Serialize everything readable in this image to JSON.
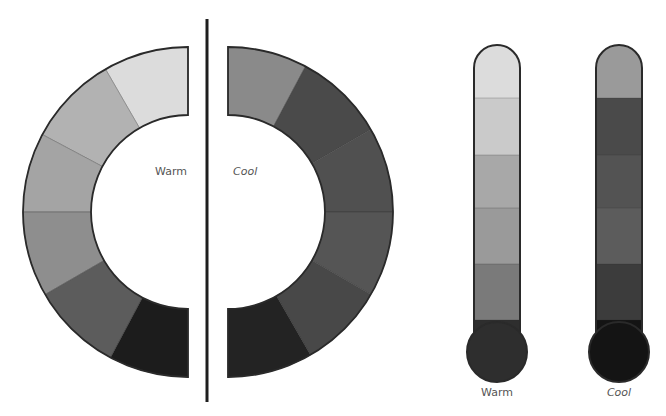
{
  "labels": {
    "ring_warm": "Warm",
    "ring_cool": "Cool",
    "thermo_warm": "Warm",
    "thermo_cool": "Cool"
  },
  "colors": {
    "outline": "#2a2a2a",
    "divider": "#1e1e1e",
    "background": "#ffffff"
  },
  "warm_ring": {
    "center": [
      188,
      212
    ],
    "outer_r": 165,
    "inner_r": 97,
    "segments": [
      {
        "name": "warm-segment-1",
        "from_deg": -90,
        "to_deg": -60,
        "color": "#dcdcdc"
      },
      {
        "name": "warm-segment-2",
        "from_deg": -60,
        "to_deg": -28,
        "color": "#b2b2b2"
      },
      {
        "name": "warm-segment-3",
        "from_deg": -28,
        "to_deg": 0,
        "color": "#a4a4a4"
      },
      {
        "name": "warm-segment-4",
        "from_deg": 0,
        "to_deg": 30,
        "color": "#8e8e8e"
      },
      {
        "name": "warm-segment-5",
        "from_deg": 30,
        "to_deg": 62,
        "color": "#5c5c5c"
      },
      {
        "name": "warm-segment-6",
        "from_deg": 62,
        "to_deg": 90,
        "color": "#1c1c1c"
      }
    ]
  },
  "cool_ring": {
    "center": [
      228,
      212
    ],
    "outer_r": 165,
    "inner_r": 97,
    "segments": [
      {
        "name": "cool-segment-1",
        "from_deg": -90,
        "to_deg": -62,
        "color": "#8a8a8a"
      },
      {
        "name": "cool-segment-2",
        "from_deg": -62,
        "to_deg": -30,
        "color": "#4a4a4a"
      },
      {
        "name": "cool-segment-3",
        "from_deg": -30,
        "to_deg": 0,
        "color": "#505050"
      },
      {
        "name": "cool-segment-4",
        "from_deg": 0,
        "to_deg": 30,
        "color": "#555555"
      },
      {
        "name": "cool-segment-5",
        "from_deg": 30,
        "to_deg": 60,
        "color": "#484848"
      },
      {
        "name": "cool-segment-6",
        "from_deg": 60,
        "to_deg": 90,
        "color": "#232323"
      }
    ]
  },
  "thermometers": [
    {
      "name": "warm-thermometer",
      "x": 474,
      "width": 46,
      "top": 45,
      "bulb_cx": 497,
      "bulb_cy": 352,
      "bulb_r": 30,
      "bands": [
        {
          "top": 45,
          "bottom": 98,
          "color": "#dcdcdc"
        },
        {
          "top": 98,
          "bottom": 155,
          "color": "#cacaca"
        },
        {
          "top": 155,
          "bottom": 208,
          "color": "#a8a8a8"
        },
        {
          "top": 208,
          "bottom": 264,
          "color": "#9a9a9a"
        },
        {
          "top": 264,
          "bottom": 320,
          "color": "#7a7a7a"
        },
        {
          "top": 320,
          "bottom": 352,
          "color": "#2e2e2e"
        }
      ],
      "bulb_color": "#2e2e2e"
    },
    {
      "name": "cool-thermometer",
      "x": 596,
      "width": 46,
      "top": 45,
      "bulb_cx": 619,
      "bulb_cy": 352,
      "bulb_r": 30,
      "bands": [
        {
          "top": 45,
          "bottom": 98,
          "color": "#9a9a9a"
        },
        {
          "top": 98,
          "bottom": 155,
          "color": "#4a4a4a"
        },
        {
          "top": 155,
          "bottom": 208,
          "color": "#535353"
        },
        {
          "top": 208,
          "bottom": 264,
          "color": "#5c5c5c"
        },
        {
          "top": 264,
          "bottom": 320,
          "color": "#3c3c3c"
        },
        {
          "top": 320,
          "bottom": 352,
          "color": "#141414"
        }
      ],
      "bulb_color": "#141414"
    }
  ]
}
